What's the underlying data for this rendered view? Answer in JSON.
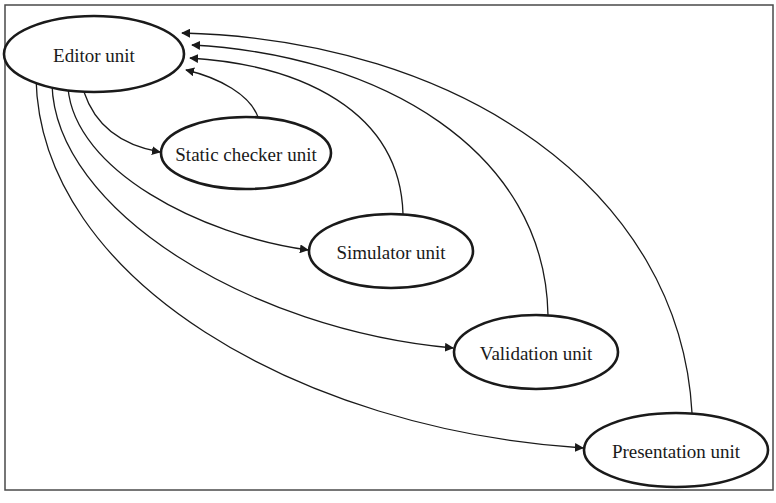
{
  "diagram": {
    "type": "directed-graph",
    "frame": {
      "stroke": "#4a4a4a"
    },
    "nodes": [
      {
        "id": "editor",
        "label": "Editor unit",
        "cx": 94,
        "cy": 54,
        "rx": 90,
        "ry": 38
      },
      {
        "id": "static_checker",
        "label": "Static checker unit",
        "cx": 246,
        "cy": 153,
        "rx": 85,
        "ry": 36
      },
      {
        "id": "simulator",
        "label": "Simulator unit",
        "cx": 391,
        "cy": 251,
        "rx": 82,
        "ry": 37
      },
      {
        "id": "validation",
        "label": "Validation unit",
        "cx": 536,
        "cy": 352,
        "rx": 82,
        "ry": 37
      },
      {
        "id": "presentation",
        "label": "Presentation unit",
        "cx": 676,
        "cy": 450,
        "rx": 92,
        "ry": 37
      }
    ],
    "edges": [
      {
        "from": "editor",
        "to": "static_checker"
      },
      {
        "from": "editor",
        "to": "simulator"
      },
      {
        "from": "editor",
        "to": "validation"
      },
      {
        "from": "editor",
        "to": "presentation"
      },
      {
        "from": "static_checker",
        "to": "editor"
      },
      {
        "from": "simulator",
        "to": "editor"
      },
      {
        "from": "validation",
        "to": "editor"
      },
      {
        "from": "presentation",
        "to": "editor"
      }
    ]
  }
}
